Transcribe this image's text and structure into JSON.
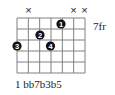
{
  "chord": {
    "fret_label": "7fr",
    "interval_labels": "1 bb7b3b5",
    "grid": {
      "x0": 17,
      "x1": 85,
      "y0": 18,
      "y1": 73,
      "vertical_lines": 7,
      "horizontal_lines": 6,
      "line_color": "#808080"
    },
    "muted_markers": [
      {
        "x": 28.5,
        "label": "×"
      },
      {
        "x": 73.5,
        "label": "×"
      },
      {
        "x": 84.5,
        "label": "×"
      }
    ],
    "dots": [
      {
        "finger": "1",
        "x": 61,
        "y": 24
      },
      {
        "finger": "2",
        "x": 40,
        "y": 35
      },
      {
        "finger": "3",
        "x": 17,
        "y": 46
      },
      {
        "finger": "4",
        "x": 50.5,
        "y": 46
      }
    ],
    "colors": {
      "dot": "#111111",
      "dot_text": "#ffffff",
      "text": "#222222"
    }
  }
}
